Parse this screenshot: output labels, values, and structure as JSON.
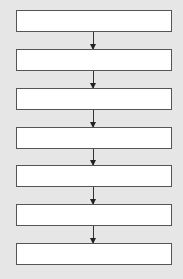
{
  "diagram": {
    "type": "flowchart",
    "direction": "top-to-bottom",
    "nodes": [
      {
        "id": 1,
        "label": ""
      },
      {
        "id": 2,
        "label": ""
      },
      {
        "id": 3,
        "label": ""
      },
      {
        "id": 4,
        "label": ""
      },
      {
        "id": 5,
        "label": ""
      },
      {
        "id": 6,
        "label": ""
      },
      {
        "id": 7,
        "label": ""
      }
    ],
    "edges": [
      {
        "from": 1,
        "to": 2
      },
      {
        "from": 2,
        "to": 3
      },
      {
        "from": 3,
        "to": 4
      },
      {
        "from": 4,
        "to": 5
      },
      {
        "from": 5,
        "to": 6
      },
      {
        "from": 6,
        "to": 7
      }
    ],
    "colors": {
      "background": "#e6e6e6",
      "box_fill": "#ffffff",
      "border": "#555555",
      "arrow": "#333333"
    }
  }
}
